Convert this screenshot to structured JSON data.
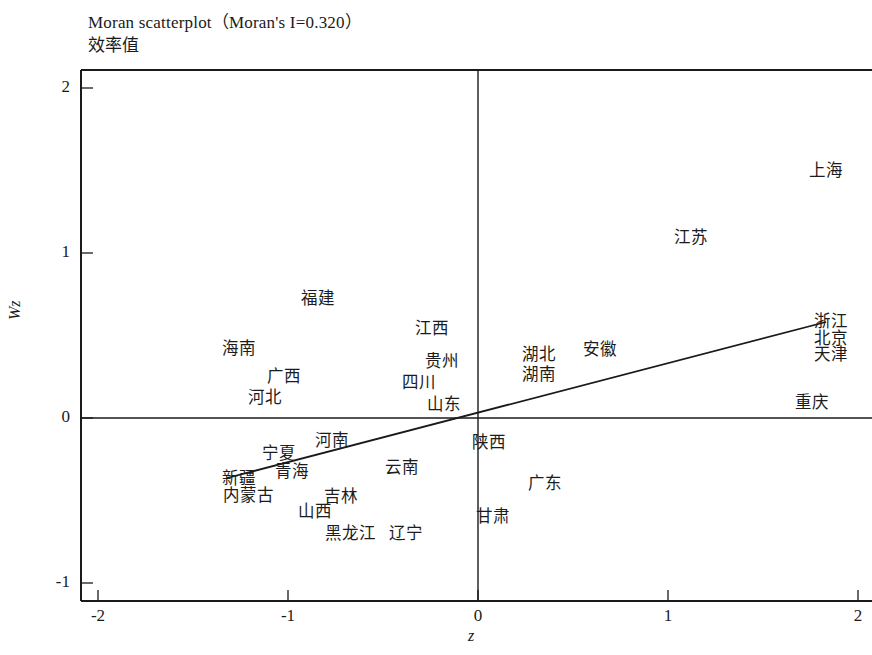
{
  "chart_data": {
    "type": "scatter",
    "title": "Moran scatterplot（Moran's I=0.320）",
    "subtitle": "效率值",
    "xlabel": "z",
    "ylabel": "Wz",
    "xlim": [
      -2,
      2
    ],
    "ylim": [
      -1,
      2
    ],
    "xticks": [
      "-2",
      "-1",
      "0",
      "1",
      "2"
    ],
    "yticks": [
      "2",
      "1",
      "0",
      "-1"
    ],
    "morans_i": "0.320",
    "grid": false,
    "legend": null,
    "reference_lines": {
      "vertical_x": 0,
      "horizontal_y": 0
    },
    "regression_line": {
      "slope": 0.32,
      "intercept": 0,
      "x_start": -1.32,
      "x_end": 1.83,
      "y_start": -0.36,
      "y_end": 0.58
    },
    "points": [
      {
        "label": "上海",
        "x": 1.83,
        "y": 1.5
      },
      {
        "label": "江苏",
        "x": 1.12,
        "y": 1.09
      },
      {
        "label": "福建",
        "x": -0.84,
        "y": 0.72
      },
      {
        "label": "江西",
        "x": -0.24,
        "y": 0.54
      },
      {
        "label": "海南",
        "x": -1.26,
        "y": 0.42
      },
      {
        "label": "贵州",
        "x": -0.19,
        "y": 0.34
      },
      {
        "label": "湖北",
        "x": 0.32,
        "y": 0.38
      },
      {
        "label": "安徽",
        "x": 0.64,
        "y": 0.41
      },
      {
        "label": "浙江",
        "x": 1.86,
        "y": 0.58
      },
      {
        "label": "北京",
        "x": 1.86,
        "y": 0.48
      },
      {
        "label": "天津",
        "x": 1.86,
        "y": 0.38
      },
      {
        "label": "湖南",
        "x": 0.32,
        "y": 0.26
      },
      {
        "label": "广西",
        "x": -1.02,
        "y": 0.25
      },
      {
        "label": "四川",
        "x": -0.31,
        "y": 0.21
      },
      {
        "label": "河北",
        "x": -1.12,
        "y": 0.12
      },
      {
        "label": "山东",
        "x": -0.18,
        "y": 0.08
      },
      {
        "label": "重庆",
        "x": 1.76,
        "y": 0.09
      },
      {
        "label": "河南",
        "x": -0.77,
        "y": -0.14
      },
      {
        "label": "陕西",
        "x": 0.06,
        "y": -0.15
      },
      {
        "label": "宁夏",
        "x": -1.05,
        "y": -0.22
      },
      {
        "label": "云南",
        "x": -0.4,
        "y": -0.3
      },
      {
        "label": "青海",
        "x": -0.98,
        "y": -0.33
      },
      {
        "label": "新疆",
        "x": -1.26,
        "y": -0.37
      },
      {
        "label": "广东",
        "x": 0.35,
        "y": -0.4
      },
      {
        "label": "内蒙古",
        "x": -1.21,
        "y": -0.47
      },
      {
        "label": "吉林",
        "x": -0.72,
        "y": -0.48
      },
      {
        "label": "山西",
        "x": -0.86,
        "y": -0.57
      },
      {
        "label": "甘肃",
        "x": 0.08,
        "y": -0.6
      },
      {
        "label": "黑龙江",
        "x": -0.67,
        "y": -0.7
      },
      {
        "label": "辽宁",
        "x": -0.38,
        "y": -0.7
      }
    ]
  },
  "chart": {
    "title": "Moran scatterplot（Moran's I=0.320）",
    "subtitle": "效率值",
    "xlabel": "z",
    "ylabel": "Wz"
  }
}
